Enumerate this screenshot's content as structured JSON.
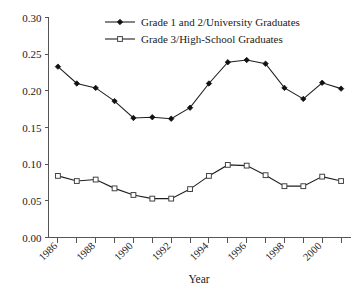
{
  "chart_data": {
    "type": "line",
    "title": "",
    "xlabel": "Year",
    "ylabel": "",
    "x": [
      1986,
      1987,
      1988,
      1989,
      1990,
      1991,
      1992,
      1993,
      1994,
      1995,
      1996,
      1997,
      1998,
      1999,
      2000,
      2001
    ],
    "xtick_labels": [
      "1986",
      "1988",
      "1990",
      "1992",
      "1994",
      "1996",
      "1998",
      "2000"
    ],
    "xtick_values": [
      1986,
      1988,
      1990,
      1992,
      1994,
      1996,
      1998,
      2000
    ],
    "xlim": [
      1985.5,
      2001.5
    ],
    "ytick_labels": [
      "0.00",
      "0.05",
      "0.10",
      "0.15",
      "0.20",
      "0.25",
      "0.30"
    ],
    "ytick_values": [
      0.0,
      0.05,
      0.1,
      0.15,
      0.2,
      0.25,
      0.3
    ],
    "ylim": [
      0.0,
      0.3
    ],
    "grid": false,
    "legend_position": "top-center",
    "series": [
      {
        "name": "Grade 1 and 2/University Graduates",
        "marker": "filled-diamond",
        "color": "#111111",
        "values": [
          0.233,
          0.21,
          0.204,
          0.186,
          0.163,
          0.164,
          0.162,
          0.177,
          0.21,
          0.239,
          0.242,
          0.237,
          0.204,
          0.189,
          0.211,
          0.203
        ]
      },
      {
        "name": "Grade 3/High-School Graduates",
        "marker": "open-square",
        "color": "#444444",
        "values": [
          0.084,
          0.077,
          0.079,
          0.067,
          0.058,
          0.053,
          0.053,
          0.066,
          0.084,
          0.099,
          0.098,
          0.085,
          0.07,
          0.07,
          0.083,
          0.077
        ]
      }
    ]
  },
  "legend": {
    "items": [
      {
        "label": "Grade 1 and 2/University Graduates",
        "marker": "filled-diamond"
      },
      {
        "label": "Grade 3/High-School Graduates",
        "marker": "open-square"
      }
    ]
  },
  "axis": {
    "x_title": "Year"
  }
}
